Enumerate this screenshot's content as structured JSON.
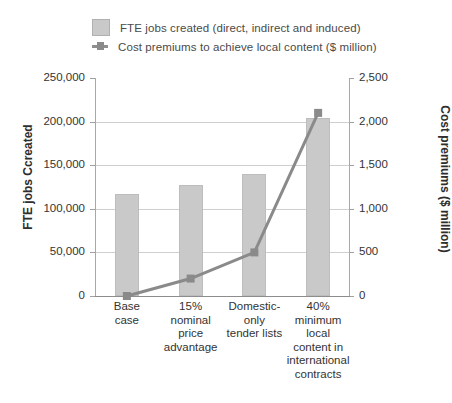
{
  "legend": {
    "items": [
      {
        "key": "bar-series",
        "label": "FTE jobs created (direct, indirect and induced)",
        "marker": "filled-square-swatch",
        "color": "#c9c9c9"
      },
      {
        "key": "line-series",
        "label": "Cost premiums to achieve local content ($ million)",
        "marker": "line-with-square-marker",
        "color": "#8a8a8a"
      }
    ]
  },
  "axes": {
    "left_title": "FTE jobs Ccreated",
    "right_title": "Cost premiums ($ million)",
    "left_ticks": [
      "250,000",
      "200,000",
      "150,000",
      "100,000",
      "50,000",
      "0"
    ],
    "right_ticks": [
      "2,500",
      "2,000",
      "1,500",
      "1,000",
      "500",
      "0"
    ]
  },
  "chart_data": {
    "type": "bar",
    "title": "",
    "xlabel": "",
    "categories": [
      "Base case",
      "15% nominal price advantage",
      "Domestic-only tender lists",
      "40% minimum local content in international contracts"
    ],
    "category_lines": [
      [
        "Base",
        "case"
      ],
      [
        "15%",
        "nominal",
        "price",
        "advantage"
      ],
      [
        "Domestic-",
        "only",
        "tender lists"
      ],
      [
        "40%",
        "minimum",
        "local",
        "content in",
        "international",
        "contracts"
      ]
    ],
    "series": [
      {
        "name": "FTE jobs created (direct, indirect and induced)",
        "type": "bar",
        "axis": "left",
        "ylabel": "FTE jobs Ccreated",
        "ylim": [
          0,
          250000
        ],
        "ytick_step": 50000,
        "color": "#c9c9c9",
        "values": [
          117000,
          127000,
          140000,
          204000
        ]
      },
      {
        "name": "Cost premiums to achieve local content ($ million)",
        "type": "line",
        "axis": "right",
        "ylabel": "Cost premiums ($ million)",
        "ylim": [
          0,
          2500
        ],
        "ytick_step": 500,
        "color": "#8a8a8a",
        "values": [
          0,
          200,
          500,
          2100
        ]
      }
    ],
    "grid": "horizontal",
    "legend_position": "top-left"
  }
}
